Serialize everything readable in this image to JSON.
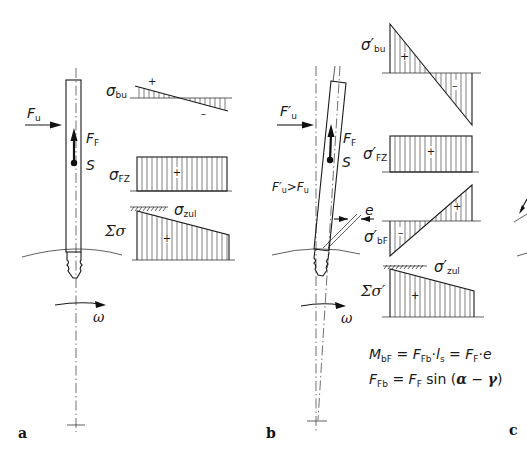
{
  "figure": {
    "panels": [
      {
        "id": "a",
        "label": "a",
        "force_label": "F",
        "force_sub": "u",
        "centrifugal_label": "F",
        "centrifugal_sub": "F",
        "center_label": "S",
        "omega_label": "ω",
        "diagrams": [
          {
            "symbol": "σ",
            "sub": "bu",
            "sign_pos": "+",
            "sign_neg": "–",
            "shape": "small linear, crossing zero at midpoint"
          },
          {
            "symbol": "σ",
            "sub": "FZ",
            "sign_pos": "+",
            "shape": "uniform rectangle"
          },
          {
            "symbol": "Σσ",
            "sub": "",
            "sign_pos": "+",
            "limit_symbol": "σ",
            "limit_sub": "zul",
            "shape": "trapezoid decreasing to right"
          }
        ]
      },
      {
        "id": "b",
        "label": "b",
        "force_label": "F′",
        "force_sub": "u",
        "comparison_label": "F′u>Fu",
        "comparison_parts": {
          "lhs": "F′",
          "lhs_sub": "u",
          "op": ">",
          "rhs": "F",
          "rhs_sub": "u"
        },
        "centrifugal_label": "F",
        "centrifugal_sub": "F",
        "center_label": "S",
        "eccentricity_label": "e",
        "omega_label": "ω",
        "diagrams": [
          {
            "symbol": "σ′",
            "sub": "bu",
            "sign_pos": "+",
            "sign_neg": "–",
            "shape": "large linear, crossing zero at midpoint"
          },
          {
            "symbol": "σ′",
            "sub": "FZ",
            "sign_pos": "+",
            "shape": "uniform rectangle"
          },
          {
            "symbol": "σ′",
            "sub": "bF",
            "sign_pos": "+",
            "sign_neg": "–",
            "shape": "linear, negative left, positive right"
          },
          {
            "symbol": "Σσ′",
            "sub": "",
            "sign_pos": "+",
            "limit_symbol": "σ′",
            "limit_sub": "zul",
            "shape": "trapezoid decreasing to right"
          }
        ],
        "equations": [
          {
            "text": "M_bF = F_Fb · l_s = F_F · e",
            "parts": [
              "M",
              "bF",
              " = ",
              "F",
              "Fb",
              "·",
              "l",
              "s",
              " = ",
              "F",
              "F",
              "·",
              "e"
            ]
          },
          {
            "text": "F_Fb = F_F sin (α − γ)",
            "parts": [
              "F",
              "Fb",
              " = ",
              "F",
              "F",
              " sin (",
              "α",
              " − ",
              "γ",
              ")"
            ]
          }
        ]
      },
      {
        "id": "c",
        "label": "c"
      }
    ]
  }
}
